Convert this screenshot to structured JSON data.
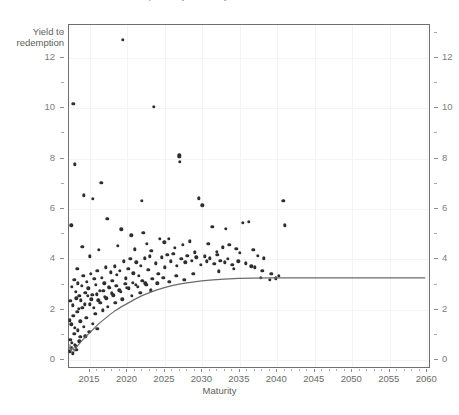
{
  "title": "Yield to redemption by maturity",
  "axis": {
    "y_title_line1": "Yield to",
    "y_title_line2": "redemption",
    "x_title": "Maturity",
    "y_ticks": [
      "0",
      "2",
      "4",
      "6",
      "8",
      "10",
      "12"
    ],
    "y_ticks_right": [
      "0",
      "2",
      "4",
      "6",
      "8",
      "10",
      "12"
    ],
    "x_ticks": [
      "2015",
      "2020",
      "2025",
      "2030",
      "2035",
      "2040",
      "2045",
      "2050",
      "2055",
      "2060"
    ]
  },
  "colors": {
    "point": "#2e2e2e",
    "curve": "#6b6b6b",
    "axis": "#6f6f6f",
    "grid": "#f4f4f4",
    "tick_label": "#6a6a6a"
  },
  "chart_data": {
    "type": "scatter",
    "title": "Yield to redemption by maturity",
    "xlabel": "Maturity",
    "ylabel": "Yield to redemption",
    "xlim": [
      2012.2,
      2060.5
    ],
    "ylim": [
      -0.35,
      13.3
    ],
    "grid": true,
    "legend": "none",
    "series": [
      {
        "name": "Bonds",
        "type": "scatter",
        "x": [
          2019.4,
          2012.8,
          2023.5,
          2013.0,
          2026.9,
          2026.9,
          2027.0,
          2012.5,
          2016.5,
          2014.2,
          2015.4,
          2017.3,
          2021.9,
          2029.5,
          2030.0,
          2040.8,
          2013.3,
          2022.1,
          2024.3,
          2031.3,
          2033.1,
          2035.4,
          2036.2,
          2041.0,
          2014.0,
          2015.0,
          2016.2,
          2018.7,
          2019.2,
          2020.5,
          2021.0,
          2022.6,
          2023.2,
          2024.9,
          2025.5,
          2026.3,
          2027.4,
          2028.3,
          2029.0,
          2030.8,
          2031.9,
          2032.7,
          2033.6,
          2034.5,
          2035.0,
          2036.8,
          2037.4,
          2038.2,
          2012.6,
          2012.9,
          2013.1,
          2013.4,
          2013.6,
          2013.9,
          2014.1,
          2014.4,
          2014.6,
          2014.8,
          2015.1,
          2015.3,
          2015.6,
          2015.8,
          2016.0,
          2016.3,
          2016.6,
          2016.9,
          2017.1,
          2017.5,
          2017.8,
          2018.0,
          2018.3,
          2018.6,
          2019.0,
          2019.5,
          2019.8,
          2020.1,
          2020.4,
          2020.8,
          2021.2,
          2021.5,
          2021.8,
          2022.3,
          2022.8,
          2023.0,
          2023.8,
          2024.1,
          2024.6,
          2025.0,
          2025.3,
          2025.8,
          2026.1,
          2026.6,
          2027.2,
          2027.7,
          2028.0,
          2028.6,
          2029.2,
          2029.8,
          2030.3,
          2030.6,
          2031.0,
          2031.6,
          2032.0,
          2032.4,
          2033.0,
          2033.4,
          2034.0,
          2034.8,
          2035.8,
          2036.5,
          2037.0,
          2038.0,
          2039.2,
          2040.2,
          2012.4,
          2012.7,
          2013.2,
          2013.5,
          2013.8,
          2014.3,
          2014.7,
          2015.2,
          2015.5,
          2015.9,
          2016.4,
          2016.8,
          2017.2,
          2017.6,
          2018.1,
          2018.5,
          2019.1,
          2019.7,
          2020.2,
          2020.7,
          2021.4,
          2022.0,
          2022.5,
          2023.3,
          2024.0,
          2024.8,
          2025.6,
          2026.5,
          2027.6,
          2028.8,
          2012.3,
          2012.5,
          2012.8,
          2013.0,
          2013.3,
          2013.7,
          2014.0,
          2014.5,
          2015.0,
          2015.7,
          2016.1,
          2016.7,
          2017.0,
          2017.4,
          2017.9,
          2018.4,
          2018.9,
          2019.3,
          2019.9,
          2020.6,
          2021.1,
          2021.7,
          2022.4,
          2023.1,
          2012.4,
          2012.6,
          2012.9,
          2013.1,
          2013.4,
          2013.7,
          2014.2,
          2014.9,
          2015.4,
          2016.0,
          2012.3,
          2012.5,
          2012.7,
          2013.0,
          2013.2,
          2013.6,
          2014.4,
          2032.2,
          2034.2,
          2037.8,
          2039.0,
          2039.8
        ],
        "y": [
          12.72,
          10.18,
          10.05,
          7.78,
          8.13,
          8.06,
          7.86,
          5.35,
          7.05,
          6.55,
          6.4,
          5.62,
          6.33,
          6.43,
          6.15,
          6.33,
          3.62,
          5.05,
          4.82,
          5.3,
          5.22,
          5.45,
          5.48,
          5.35,
          4.5,
          4.12,
          4.38,
          4.55,
          5.2,
          4.95,
          4.4,
          4.62,
          4.35,
          4.68,
          4.82,
          4.45,
          4.58,
          4.72,
          4.28,
          4.62,
          4.3,
          4.48,
          4.58,
          4.42,
          4.25,
          4.38,
          4.15,
          4.05,
          2.9,
          3.18,
          2.72,
          3.05,
          2.55,
          2.95,
          3.35,
          2.68,
          3.1,
          2.85,
          3.42,
          2.6,
          3.22,
          2.98,
          3.55,
          2.75,
          3.28,
          3.05,
          3.68,
          2.92,
          3.48,
          3.15,
          3.72,
          3.38,
          3.55,
          3.92,
          3.25,
          3.62,
          4.02,
          3.45,
          3.88,
          3.35,
          3.75,
          4.05,
          3.58,
          4.12,
          3.85,
          3.42,
          4.08,
          3.68,
          4.18,
          3.92,
          4.22,
          3.75,
          4.02,
          3.88,
          4.15,
          3.95,
          4.08,
          3.78,
          4.12,
          3.92,
          4.05,
          3.82,
          4.18,
          3.95,
          3.88,
          4.02,
          3.78,
          3.92,
          3.85,
          3.72,
          3.68,
          3.55,
          3.42,
          3.35,
          2.35,
          2.18,
          2.45,
          2.05,
          2.38,
          2.22,
          2.55,
          2.42,
          2.08,
          2.62,
          2.28,
          2.75,
          2.45,
          2.88,
          2.58,
          2.95,
          2.72,
          3.02,
          2.85,
          3.08,
          2.92,
          3.15,
          2.98,
          3.22,
          3.05,
          3.28,
          3.12,
          3.35,
          3.18,
          3.42,
          1.58,
          1.42,
          1.75,
          1.28,
          1.92,
          1.55,
          2.08,
          1.68,
          2.22,
          1.85,
          2.38,
          1.98,
          2.52,
          2.12,
          2.65,
          2.28,
          2.78,
          2.42,
          2.88,
          2.55,
          2.98,
          2.68,
          3.05,
          2.78,
          0.82,
          0.68,
          1.05,
          0.55,
          1.18,
          0.92,
          1.32,
          1.12,
          1.45,
          1.25,
          0.35,
          0.48,
          0.28,
          0.62,
          0.42,
          0.75,
          0.95,
          3.52,
          3.62,
          3.28,
          3.18,
          3.25
        ]
      },
      {
        "name": "Fitted yield curve",
        "type": "line",
        "x": [
          2012.3,
          2012.5,
          2012.7,
          2012.9,
          2013.2,
          2013.6,
          2014.0,
          2014.5,
          2015.0,
          2015.6,
          2016.2,
          2016.9,
          2017.6,
          2018.4,
          2019.2,
          2020.0,
          2021.0,
          2022.0,
          2023.0,
          2024.0,
          2025.0,
          2026.0,
          2027.0,
          2028.0,
          2029.0,
          2030.0,
          2031.5,
          2033.0,
          2035.0,
          2037.0,
          2039.0,
          2041.0,
          2045.0,
          2050.0,
          2055.0,
          2060.0
        ],
        "y": [
          0.55,
          0.3,
          0.42,
          0.3,
          0.45,
          0.58,
          0.72,
          0.88,
          1.02,
          1.2,
          1.38,
          1.55,
          1.72,
          1.9,
          2.05,
          2.18,
          2.35,
          2.5,
          2.62,
          2.73,
          2.82,
          2.9,
          2.96,
          3.01,
          3.05,
          3.09,
          3.13,
          3.16,
          3.19,
          3.2,
          3.21,
          3.21,
          3.21,
          3.21,
          3.21,
          3.21
        ]
      }
    ]
  }
}
